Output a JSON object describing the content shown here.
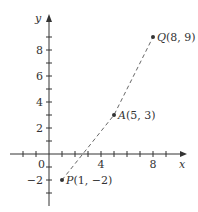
{
  "chart_data": {
    "type": "scatter",
    "title": "",
    "xlabel": "x",
    "ylabel": "y",
    "xlim": [
      -3,
      10
    ],
    "ylim": [
      -4,
      10.5
    ],
    "grid": false,
    "x_ticks": [
      -2,
      -1,
      1,
      2,
      3,
      4,
      5,
      6,
      7,
      8,
      9
    ],
    "x_tick_labels": {
      "4": "4",
      "8": "8"
    },
    "y_ticks": [
      -3,
      -2,
      -1,
      1,
      2,
      3,
      4,
      5,
      6,
      7,
      8,
      9
    ],
    "y_tick_labels": {
      "-2": "−2",
      "2": "2",
      "4": "4",
      "6": "6",
      "8": "8"
    },
    "origin_label": "0",
    "points": [
      {
        "name": "P",
        "x": 1,
        "y": -2,
        "label": "P(1, −2)",
        "label_name": "P",
        "label_coords": "(1, −2)"
      },
      {
        "name": "A",
        "x": 5,
        "y": 3,
        "label": "A(5, 3)",
        "label_name": "A",
        "label_coords": "(5, 3)"
      },
      {
        "name": "Q",
        "x": 8,
        "y": 9,
        "label": "Q(8, 9)",
        "label_name": "Q",
        "label_coords": "(8, 9)"
      }
    ],
    "series": [
      {
        "name": "dashed path P-A-Q",
        "style": "dashed",
        "x": [
          1,
          5,
          8
        ],
        "y": [
          -2,
          3,
          9
        ]
      }
    ]
  }
}
